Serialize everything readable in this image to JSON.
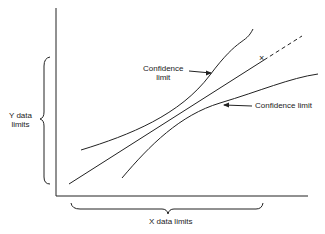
{
  "diagram": {
    "labels": {
      "upper_confidence": [
        "Confidence",
        "limit"
      ],
      "lower_confidence": "Confidence limit",
      "y_limits": [
        "Y data",
        "limits"
      ],
      "x_limits": "X data limits"
    },
    "marker": "×",
    "colors": {
      "ink": "#222222",
      "background": "#ffffff"
    }
  }
}
